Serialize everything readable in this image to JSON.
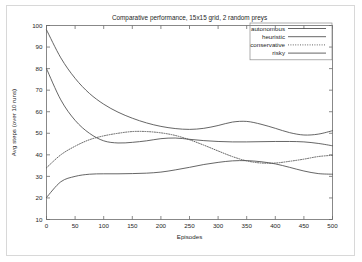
{
  "chart_data": {
    "type": "line",
    "title": "Comparative performance, 15x15 grid, 2 random preys",
    "xlabel": "Episodes",
    "ylabel": "Avg steps (over 10 runs)",
    "xlim": [
      0,
      500
    ],
    "ylim": [
      10,
      100
    ],
    "xticks": [
      0,
      50,
      100,
      150,
      200,
      250,
      300,
      350,
      400,
      450,
      500
    ],
    "yticks": [
      10,
      20,
      30,
      40,
      50,
      60,
      70,
      80,
      90,
      100
    ],
    "grid": false,
    "legend_position": "top-right",
    "x": [
      0,
      25,
      50,
      75,
      100,
      125,
      150,
      175,
      200,
      225,
      250,
      275,
      300,
      325,
      350,
      375,
      400,
      425,
      450,
      475,
      500
    ],
    "series": [
      {
        "name": "autonomous",
        "style": "solid",
        "color": "#4a4a4a",
        "values": [
          98.0,
          85.0,
          75.5,
          68.5,
          63.5,
          59.8,
          57.0,
          54.8,
          53.2,
          52.2,
          51.8,
          52.3,
          53.6,
          55.2,
          55.5,
          54.2,
          52.3,
          50.3,
          49.2,
          49.6,
          51.2
        ]
      },
      {
        "name": "heuristic",
        "style": "solid",
        "color": "#4a4a4a",
        "values": [
          80.0,
          65.5,
          56.0,
          50.0,
          46.5,
          45.5,
          45.8,
          46.5,
          47.5,
          47.8,
          47.2,
          46.6,
          46.2,
          46.0,
          46.0,
          46.1,
          46.2,
          46.2,
          46.0,
          45.3,
          44.2
        ]
      },
      {
        "name": "conservative",
        "style": "dotted",
        "color": "#4a4a4a",
        "values": [
          34.0,
          40.0,
          44.0,
          47.0,
          48.8,
          50.0,
          50.8,
          50.8,
          50.2,
          49.0,
          47.0,
          44.5,
          41.8,
          39.2,
          37.2,
          36.2,
          36.2,
          37.0,
          38.0,
          39.2,
          39.8
        ]
      },
      {
        "name": "risky",
        "style": "solid",
        "color": "#4a4a4a",
        "values": [
          20.2,
          27.5,
          30.0,
          31.0,
          31.2,
          31.2,
          31.3,
          31.5,
          32.0,
          33.0,
          34.2,
          35.5,
          36.5,
          37.2,
          37.3,
          36.8,
          35.8,
          34.2,
          32.5,
          31.3,
          31.0
        ]
      }
    ]
  }
}
